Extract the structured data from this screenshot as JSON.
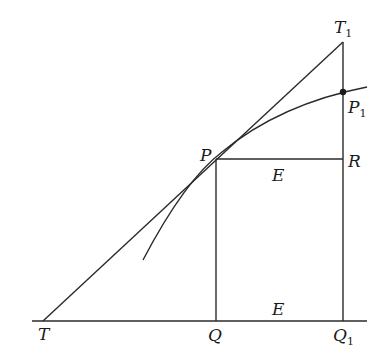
{
  "diagram": {
    "type": "geometric construction: tangent to curve",
    "stroke_color": "#2a2a2a",
    "points": {
      "T": {
        "label": "T",
        "sub": ""
      },
      "T1": {
        "label": "T",
        "sub": "1"
      },
      "P": {
        "label": "P",
        "sub": ""
      },
      "P1": {
        "label": "P",
        "sub": "1"
      },
      "R": {
        "label": "R",
        "sub": ""
      },
      "Q": {
        "label": "Q",
        "sub": ""
      },
      "Q1": {
        "label": "Q",
        "sub": "1"
      }
    },
    "region_labels": {
      "upper": "E",
      "lower": "E"
    }
  }
}
